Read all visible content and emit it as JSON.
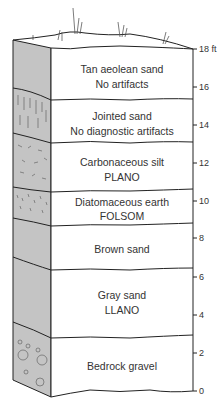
{
  "diagram": {
    "type": "stratigraphic-column",
    "scale_unit": "ft",
    "scale_ticks": [
      {
        "label": "18 ft",
        "value": 18
      },
      {
        "label": "16",
        "value": 16
      },
      {
        "label": "14",
        "value": 14
      },
      {
        "label": "12",
        "value": 12
      },
      {
        "label": "10",
        "value": 10
      },
      {
        "label": "8",
        "value": 8
      },
      {
        "label": "6",
        "value": 6
      },
      {
        "label": "4",
        "value": 4
      },
      {
        "label": "2",
        "value": 2
      },
      {
        "label": "0",
        "value": 0
      }
    ],
    "layers": [
      {
        "line1": "Tan aeolean sand",
        "line2": "No artifacts"
      },
      {
        "line1": "Jointed sand",
        "line2": "No diagnostic artifacts"
      },
      {
        "line1": "Carbonaceous silt",
        "line2": "PLANO"
      },
      {
        "line1": "Diatomaceous earth",
        "line2": "FOLSOM"
      },
      {
        "line1": "Brown sand",
        "line2": ""
      },
      {
        "line1": "Gray sand",
        "line2": "LLANO"
      },
      {
        "line1": "Bedrock gravel",
        "line2": ""
      }
    ],
    "colors": {
      "side_fill": "#c4c4c4",
      "line": "#222222",
      "text": "#333333"
    }
  }
}
